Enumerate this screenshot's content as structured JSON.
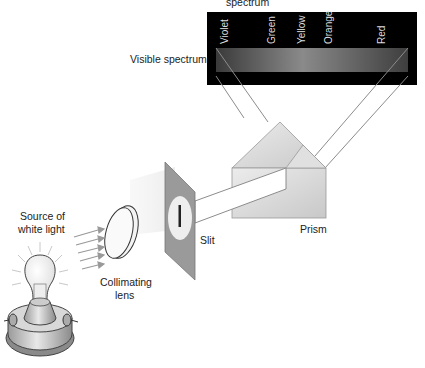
{
  "title_fragment": "spectrum",
  "labels": {
    "visible_spectrum": "Visible spectrum",
    "source": [
      "Source of",
      "white light"
    ],
    "lens": [
      "Collimating",
      "lens"
    ],
    "slit": "Slit",
    "prism": "Prism"
  },
  "spectrum_colors": [
    "Violet",
    "Green",
    "Yellow",
    "Orange",
    "Red"
  ],
  "colors": {
    "screen": "#000000",
    "band_dark": "#3a3a3a",
    "band_light": "#8a8a8a",
    "beam_line": "#8c8c8c",
    "prism_fill": "#d6d6d6",
    "slit_plate": "#9a9a9a"
  }
}
